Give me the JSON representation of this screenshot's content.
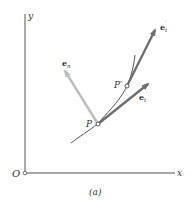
{
  "figure": {
    "caption": "(a)",
    "axes": {
      "origin_label": "O",
      "x_label": "x",
      "y_label": "y"
    },
    "points": {
      "p": "P",
      "p_prime": "P′"
    },
    "vectors": {
      "e_t": {
        "base": "e",
        "sub": "t"
      },
      "e_t_prime": {
        "base": "e",
        "sub": "t",
        "sup": "′"
      },
      "e_n": {
        "base": "e",
        "sub": "n"
      }
    },
    "colors": {
      "axis": "#555555",
      "curve": "#444444",
      "tangent_arrow": "#6e6e6e",
      "normal_arrow": "#bdbdbd",
      "text": "#333333"
    }
  }
}
